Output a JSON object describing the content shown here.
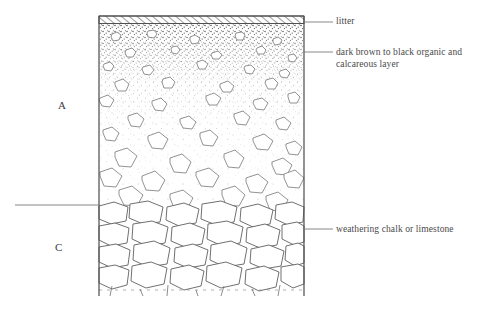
{
  "figure": {
    "type": "soil-profile-cross-section",
    "background_color": "#ffffff",
    "ink_color": "#555555"
  },
  "horizons": [
    {
      "code": "A",
      "label": "A",
      "label_x": 58,
      "label_y": 99,
      "description": "dark brown to black organic and calcareous layer grading to stony soil",
      "top_y": 23,
      "bottom_y": 205,
      "pattern": "stipple-gradient-with-angular-fragments"
    },
    {
      "code": "C",
      "label": "C",
      "label_x": 55,
      "label_y": 241,
      "description": "weathering chalk or limestone, densely packed blocky fragments",
      "top_y": 205,
      "bottom_y": 296,
      "pattern": "packed-blocky-clasts"
    }
  ],
  "litter_band": {
    "label": "litter",
    "pattern": "diagonal-hatch",
    "top_y": 16,
    "bottom_y": 23
  },
  "callouts": [
    {
      "id": "litter",
      "text": "litter",
      "leader_y": 22,
      "leader_x_start": 304,
      "leader_x_end": 333,
      "text_x": 336,
      "text_y": 16
    },
    {
      "id": "organic",
      "text": "dark brown to black organic and\ncalcareous layer",
      "leader_y": 52,
      "leader_x_start": 304,
      "leader_x_end": 333,
      "text_x": 336,
      "text_y": 47
    },
    {
      "id": "chalk",
      "text": "weathering chalk or limestone",
      "leader_y": 229,
      "leader_x_start": 304,
      "leader_x_end": 333,
      "text_x": 336,
      "text_y": 224
    }
  ],
  "left_leader": {
    "id": "horizon-boundary-leader",
    "x_start": 15,
    "x_end": 100,
    "y": 205
  },
  "profile_box": {
    "left_x": 99,
    "right_x": 304,
    "top_y": 16,
    "bottom_y": 296
  }
}
